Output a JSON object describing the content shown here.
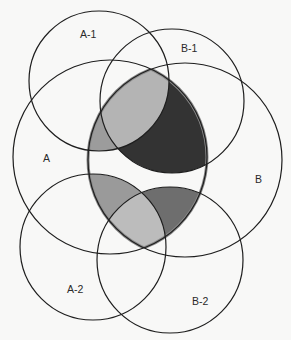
{
  "diagram": {
    "type": "venn",
    "circles": [
      {
        "id": "A-1",
        "label": "A-1",
        "cx": 99,
        "cy": 81,
        "r": 70,
        "label_x": 89,
        "label_y": 38
      },
      {
        "id": "B-1",
        "label": "B-1",
        "cx": 172,
        "cy": 101,
        "r": 72,
        "label_x": 181,
        "label_y": 52
      },
      {
        "id": "A",
        "label": "A",
        "cx": 110,
        "cy": 157,
        "r": 97,
        "label_x": 47,
        "label_y": 162
      },
      {
        "id": "B",
        "label": "B",
        "cx": 185,
        "cy": 160,
        "r": 97,
        "label_x": 259,
        "label_y": 183
      },
      {
        "id": "A-2",
        "label": "A-2",
        "cx": 93,
        "cy": 247,
        "r": 73,
        "label_x": 68,
        "label_y": 293
      },
      {
        "id": "B-2",
        "label": "B-2",
        "cx": 170,
        "cy": 260,
        "r": 73,
        "label_x": 193,
        "label_y": 305
      }
    ],
    "highlight": {
      "region": "A ∩ B",
      "border_color": "#8a8a8a",
      "border_width": 3
    },
    "shading": {
      "A-1_only": "#9c9c9c",
      "A-1_and_B-1": "#b4b4b4",
      "B-1_only": "#333333",
      "A-2_only": "#9a9a9a",
      "A-2_and_B-2": "#bcbcbc",
      "B-2_only": "#6e6e6e"
    }
  }
}
